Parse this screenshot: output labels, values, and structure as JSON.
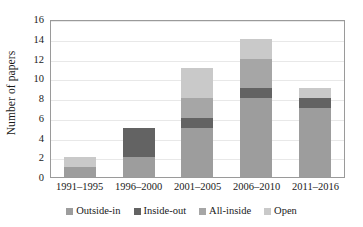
{
  "chart_data": {
    "type": "bar",
    "subtype": "stacked-bar",
    "title": "",
    "xlabel": "",
    "ylabel": "Number of papers",
    "categories": [
      "1991–1995",
      "1996–2000",
      "2001–2005",
      "2006–2010",
      "2011–2016"
    ],
    "series": [
      {
        "name": "Outside-in",
        "color": "#9d9d9d",
        "values": [
          1,
          2,
          5,
          8,
          7
        ]
      },
      {
        "name": "Inside-out",
        "color": "#636363",
        "values": [
          0,
          3,
          1,
          1,
          1
        ]
      },
      {
        "name": "All-inside",
        "color": "#a6a6a6",
        "values": [
          0,
          0,
          2,
          3,
          0
        ]
      },
      {
        "name": "Open",
        "color": "#c9c9c9",
        "values": [
          1,
          0,
          3,
          2,
          1
        ]
      }
    ],
    "totals": [
      2,
      5,
      11,
      14,
      9
    ],
    "ylim": [
      0,
      16
    ],
    "ytick_values": [
      16,
      14,
      12,
      10,
      8,
      6,
      4,
      2,
      0
    ],
    "ytick_labels": [
      "16",
      "14",
      "12",
      "10",
      "8",
      "6",
      "4",
      "2",
      "0"
    ],
    "grid": true,
    "grid_axis": "y",
    "legend_position": "bottom",
    "legend_entries": [
      "Outside-in",
      "Inside-out",
      "All-inside",
      "Open"
    ],
    "frame_color": "#9a9a9a",
    "gridline_color": "#e8e8e8",
    "background": "#ffffff"
  }
}
